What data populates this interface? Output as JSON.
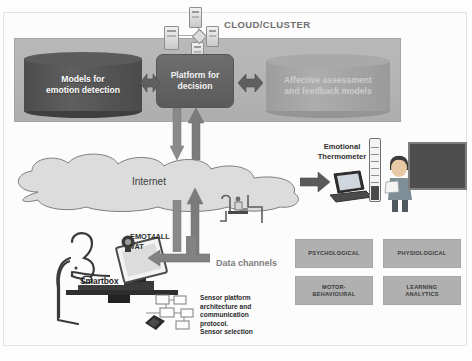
{
  "diagram": {
    "cluster": {
      "label": "CLOUD/CLUSTER",
      "servers_icon": "server-cluster-icon",
      "left_store": "Models for\nemotion detection",
      "left_store_line1": "Models for",
      "left_store_line2": "emotion detection",
      "platform_line1": "Platform for",
      "platform_line2": "decision",
      "right_store_line1": "Affective assessment",
      "right_store_line2": "and feedback models"
    },
    "network": {
      "cloud_label": "Internet",
      "cloud_icon": "cloud-icon",
      "up_arrow_icon": "arrow-up-icon",
      "down_arrow_icon": "arrow-down-icon",
      "router_icon": "workstation-router-icon"
    },
    "teacher_side": {
      "thermometer_label_line1": "Emotional",
      "thermometer_label_line2": "Thermometer",
      "thermometer_icon": "thermometer-icon",
      "laptop_icon": "laptop-icon",
      "teacher_icon": "teacher-figure-icon",
      "blackboard_icon": "blackboard-icon",
      "feed_arrow_icon": "arrow-right-icon"
    },
    "student_side": {
      "vat_label_line1": "EMOT4ALL",
      "vat_label_line2": "VAT",
      "smartbox_label": "Smartbox",
      "user_icon": "seated-person-icon",
      "monitor_icon": "desktop-monitor-icon",
      "webcam_icon": "webcam-icon",
      "mouse_icon": "computer-mouse-icon",
      "smartbox_icon": "smartbox-device-icon"
    },
    "data_channels": {
      "label": "Data channels",
      "categories": [
        "PSYCHOLOGICAL",
        "PHYSIOLOGICAL",
        "MOTOR-\nBEHAVIOURAL",
        "LEARNING\nANALYTICS"
      ],
      "cat1_line1": "PSYCHOLOGICAL",
      "cat2_line1": "PHYSIOLOGICAL",
      "cat3_line1": "MOTOR-",
      "cat3_line2": "BEHAVIOURAL",
      "cat4_line1": "LEARNING",
      "cat4_line2": "ANALYTICS"
    },
    "sensors": {
      "text_line1": "Sensor platform",
      "text_line2": "architecture and",
      "text_line3": "communication",
      "text_line4": "protocol.",
      "text_line5": "Sensor selection",
      "schematic_icon": "sensor-schematic-icon",
      "chip_icon": "sensor-chip-icon"
    },
    "colors": {
      "panel_gray": "#b3b3b3",
      "dark_cylinder": "#4c4c4c",
      "light_cylinder": "#a4a4a4",
      "platform_box": "#626262",
      "arrow_gray": "#6f6f6f",
      "category_box": "#b0b0b0",
      "blackboard": "#4e4e4e"
    }
  }
}
